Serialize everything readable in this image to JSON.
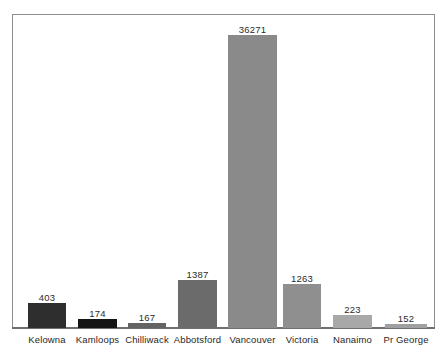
{
  "chart_data": {
    "type": "bar",
    "title": "",
    "subtitle": "",
    "xlabel": "",
    "ylabel": "",
    "grid": false,
    "legend": "none",
    "value_labels_shown": true,
    "categories": [
      "Kelowna",
      "Kamloops",
      "Chilliwack",
      "Abbotsford",
      "Vancouver",
      "Victoria",
      "Nanaimo",
      "Pr George"
    ],
    "values": [
      403,
      174,
      167,
      1387,
      36271,
      1263,
      223,
      152
    ],
    "value_labels": [
      "403",
      "174",
      "167",
      "1387",
      "36271",
      "1263",
      "223",
      "152"
    ],
    "bar_colors": [
      "#2e2e2e",
      "#151515",
      "#646464",
      "#6b6b6b",
      "#8a8a8a",
      "#8f8f8f",
      "#a8a8a8",
      "#a0a0a0"
    ],
    "ylim": [
      0,
      36271
    ],
    "note": "bar heights are rendered on a compressed scale; 36271 bar is tallest"
  },
  "style": {
    "frame_color": "#8d8d8d",
    "axis_color": "#6f6f6f",
    "background": "#ffffff",
    "label_color": "#1f1f1f",
    "value_color": "#2b2b2b"
  },
  "geometry": {
    "bars": [
      {
        "left": 28,
        "width": 38,
        "height": 25,
        "label_top": 292
      },
      {
        "left": 78,
        "width": 39,
        "height": 9,
        "label_top": 308
      },
      {
        "left": 128,
        "width": 38,
        "height": 5,
        "label_top": 312
      },
      {
        "left": 178,
        "width": 39,
        "height": 48,
        "label_top": 269
      },
      {
        "left": 228,
        "width": 49,
        "height": 293,
        "label_top": 24
      },
      {
        "left": 283,
        "width": 38,
        "height": 44,
        "label_top": 273
      },
      {
        "left": 333,
        "width": 39,
        "height": 13,
        "label_top": 304
      },
      {
        "left": 385,
        "width": 42,
        "height": 4,
        "label_top": 313
      }
    ],
    "labels": [
      {
        "left": 14,
        "width": 66
      },
      {
        "left": 64,
        "width": 67
      },
      {
        "left": 114,
        "width": 66
      },
      {
        "left": 163,
        "width": 69
      },
      {
        "left": 216,
        "width": 73
      },
      {
        "left": 269,
        "width": 66
      },
      {
        "left": 319,
        "width": 67
      },
      {
        "left": 372,
        "width": 68
      }
    ]
  }
}
